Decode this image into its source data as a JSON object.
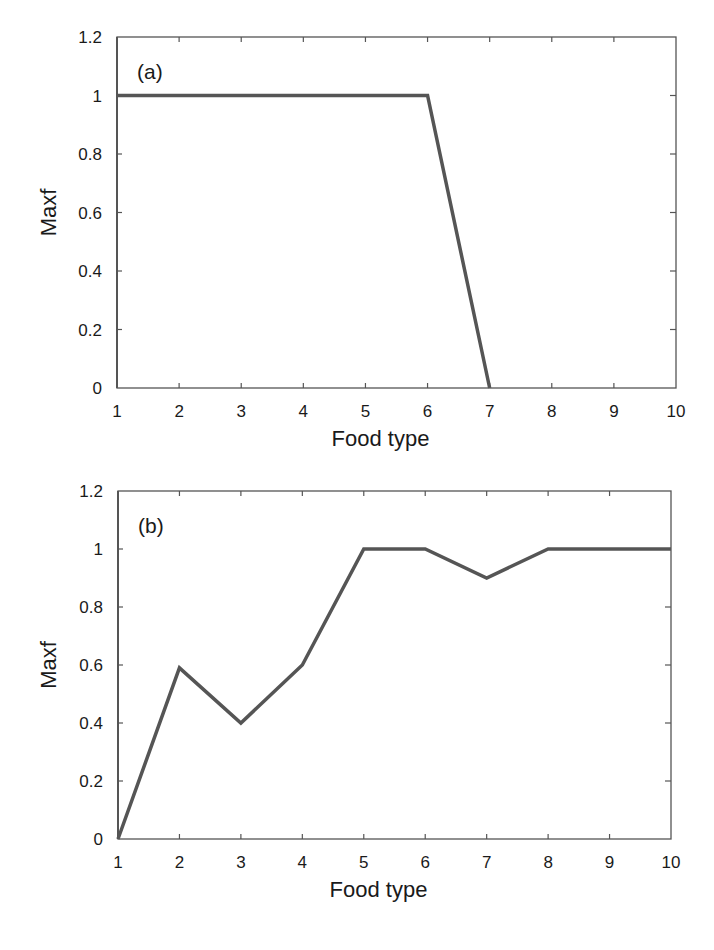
{
  "chart_data": [
    {
      "type": "line",
      "panel_label": "(a)",
      "title": "",
      "xlabel": "Food type",
      "ylabel": "Maxf",
      "x": [
        1,
        2,
        3,
        4,
        5,
        6,
        7,
        8,
        9,
        10
      ],
      "series": [
        {
          "name": "Maxf",
          "values": [
            1,
            1,
            1,
            1,
            1,
            1,
            0,
            0,
            0,
            0
          ]
        }
      ],
      "xlim": [
        1,
        10
      ],
      "ylim": [
        0,
        1.2
      ],
      "x_ticks": [
        "1",
        "2",
        "3",
        "4",
        "5",
        "6",
        "7",
        "8",
        "9",
        "10"
      ],
      "y_ticks": [
        "0",
        "0.2",
        "0.4",
        "0.6",
        "0.8",
        "1",
        "1.2"
      ],
      "grid": false,
      "legend": "none",
      "line_color": "#555555"
    },
    {
      "type": "line",
      "panel_label": "(b)",
      "title": "",
      "xlabel": "Food type",
      "ylabel": "Maxf",
      "x": [
        1,
        2,
        3,
        4,
        5,
        6,
        7,
        8,
        9,
        10
      ],
      "series": [
        {
          "name": "Maxf",
          "values": [
            0,
            0.59,
            0.4,
            0.6,
            1,
            1,
            0.9,
            1,
            1,
            1
          ]
        }
      ],
      "xlim": [
        1,
        10
      ],
      "ylim": [
        0,
        1.2
      ],
      "x_ticks": [
        "1",
        "2",
        "3",
        "4",
        "5",
        "6",
        "7",
        "8",
        "9",
        "10"
      ],
      "y_ticks": [
        "0",
        "0.2",
        "0.4",
        "0.6",
        "0.8",
        "1",
        "1.2"
      ],
      "grid": false,
      "legend": "none",
      "line_color": "#555555"
    }
  ]
}
